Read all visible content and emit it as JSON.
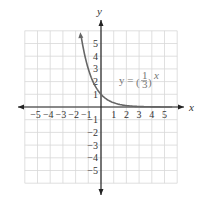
{
  "chart_data": {
    "type": "line",
    "title": "",
    "xlabel": "x",
    "ylabel": "y",
    "xlim": [
      -6,
      6
    ],
    "ylim": [
      -6,
      6
    ],
    "grid": true,
    "x_ticks": [
      "-5",
      "-4",
      "-3",
      "-2",
      "-1",
      "1",
      "2",
      "3",
      "4",
      "5"
    ],
    "y_ticks": [
      "5",
      "4",
      "3",
      "2",
      "1",
      "-1",
      "-2",
      "-3",
      "-4",
      "-5"
    ],
    "annotation": {
      "text": "y = (1/3)^x",
      "prefix": "y = ",
      "num": "1",
      "den": "3",
      "exp": "x"
    },
    "series": [
      {
        "name": "y = (1/3)^x",
        "function": "(1/3)^x",
        "x": [
          -1.6,
          -1.5,
          -1,
          -0.5,
          0,
          0.5,
          1,
          2,
          3,
          4,
          5,
          5.6
        ],
        "y": [
          5.8,
          5.2,
          3,
          1.73,
          1,
          0.58,
          0.33,
          0.11,
          0.04,
          0.01,
          0.004,
          0.002
        ],
        "color": "#666666"
      }
    ]
  },
  "labels": {
    "x_axis": "x",
    "y_axis": "y"
  }
}
